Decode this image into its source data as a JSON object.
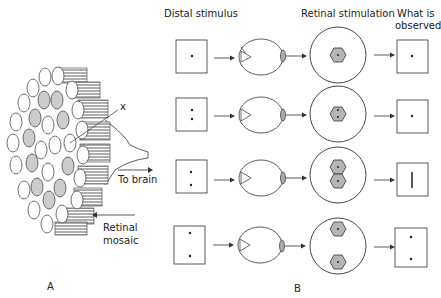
{
  "panel_a": {
    "label": "A",
    "marker_x": "x",
    "to_brain": "To brain",
    "retinal_mosaic_line1": "Retinal",
    "retinal_mosaic_line2": "mosaic"
  },
  "panel_b": {
    "label": "B",
    "headers": {
      "distal": "Distal stimulus",
      "retinal": "Retinal stimulation",
      "observed_line1": "What is",
      "observed_line2": "observed"
    },
    "rows": [
      {
        "stimulus_dots": 1,
        "retina_cells": "single center cell",
        "observed": "single dot"
      },
      {
        "stimulus_dots": 2,
        "retina_cells": "two dots in one center cell",
        "observed": "single dot"
      },
      {
        "stimulus_dots": 2,
        "retina_cells": "two adjacent cells",
        "observed": "vertical line"
      },
      {
        "stimulus_dots": 2,
        "retina_cells": "two separated cells",
        "observed": "two dots"
      }
    ]
  },
  "colors": {
    "shade": "#b5b5b5",
    "line": "#333333"
  }
}
